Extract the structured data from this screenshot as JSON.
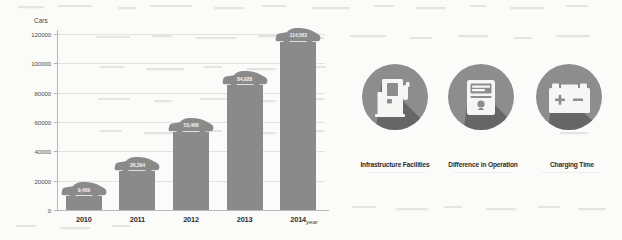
{
  "chart_data": {
    "type": "bar",
    "title": "",
    "xlabel": "year",
    "ylabel": "Cars",
    "categories": [
      "2010",
      "2011",
      "2012",
      "2013",
      "2014"
    ],
    "values": [
      9409,
      26394,
      53468,
      84928,
      114563
    ],
    "data_labels": [
      "9,409",
      "26,394",
      "53,468",
      "84,928",
      "114,563"
    ],
    "ylim": [
      0,
      120000
    ],
    "y_ticks": [
      0,
      20000,
      40000,
      60000,
      80000,
      100000,
      120000
    ],
    "y_tick_labels": [
      "0",
      "20000",
      "40000",
      "60000",
      "80000",
      "100000",
      "120000"
    ],
    "grid": true,
    "legend": "none",
    "bar_color": "#8a8a8a",
    "label_marker_shape": "car-silhouette"
  },
  "chart": {
    "y_axis_title": "Cars",
    "x_axis_title": "year"
  },
  "icons": {
    "items": [
      {
        "icon_name": "charging-station-icon",
        "label": "Infrastructure Facilities",
        "subtext": "— — —— —— ———— — —— ——— —— ———",
        "disc_color": "#8d8d8d",
        "shadow_color": "#5f5f5f",
        "glyph_color": "#f6f6f4"
      },
      {
        "icon_name": "control-meter-icon",
        "label": "Difference in Operation",
        "subtext": "— — —— —— ———— — —— ——— —— ———",
        "disc_color": "#8d8d8d",
        "shadow_color": "#5f5f5f",
        "glyph_color": "#f6f6f4"
      },
      {
        "icon_name": "battery-icon",
        "label": "Charging Time",
        "subtext": "— — —— —— ———— — —— ——— —— ———",
        "disc_color": "#8d8d8d",
        "shadow_color": "#5f5f5f",
        "glyph_color": "#f6f6f4"
      }
    ]
  }
}
